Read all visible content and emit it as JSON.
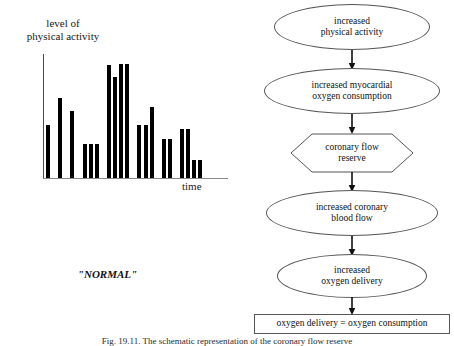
{
  "figure": {
    "caption": "Fig. 19.11. The schematic representation of the coronary flow reserve"
  },
  "chart_panel": {
    "y_axis_label_lines": [
      "level of",
      "physical activity"
    ],
    "x_axis_label": "time",
    "annotation": "\"NORMAL\""
  },
  "chart_data": {
    "type": "bar",
    "title": "",
    "xlabel": "time",
    "ylabel": "level of physical activity",
    "ylim": [
      0,
      100
    ],
    "grid": false,
    "legend": null,
    "categories": [
      "1",
      "2",
      "3",
      "4",
      "5",
      "6",
      "7",
      "8",
      "9",
      "10",
      "11",
      "12",
      "13",
      "14",
      "15",
      "16",
      "17",
      "18",
      "19",
      "20",
      "21",
      "22",
      "23",
      "24",
      "25",
      "26"
    ],
    "values": [
      36,
      0,
      54,
      0,
      45,
      0,
      23,
      23,
      23,
      0,
      76,
      68,
      77,
      77,
      0,
      36,
      36,
      48,
      0,
      26,
      26,
      0,
      33,
      33,
      12,
      12
    ],
    "bar_color": "#000000",
    "axis_color": "#4a4a4a"
  },
  "flow_chart": {
    "type": "flowchart",
    "nodes": [
      {
        "id": "increased-physical-activity",
        "shape": "ellipse",
        "lines": [
          "increased",
          "physical activity"
        ]
      },
      {
        "id": "increased-myocardial-oxygen-consumption",
        "shape": "ellipse",
        "lines": [
          "increased myocardial",
          "oxygen consumption"
        ]
      },
      {
        "id": "coronary-flow-reserve",
        "shape": "hexagon",
        "lines": [
          "coronary flow",
          "reserve"
        ]
      },
      {
        "id": "increased-coronary-blood-flow",
        "shape": "ellipse",
        "lines": [
          "increased coronary",
          "blood flow"
        ]
      },
      {
        "id": "increased-oxygen-delivery",
        "shape": "ellipse",
        "lines": [
          "increased",
          "oxygen delivery"
        ]
      },
      {
        "id": "oxygen-balance",
        "shape": "rectangle",
        "lines": [
          "oxygen delivery = oxygen consumption"
        ]
      }
    ],
    "arrow_color": "#111111"
  }
}
